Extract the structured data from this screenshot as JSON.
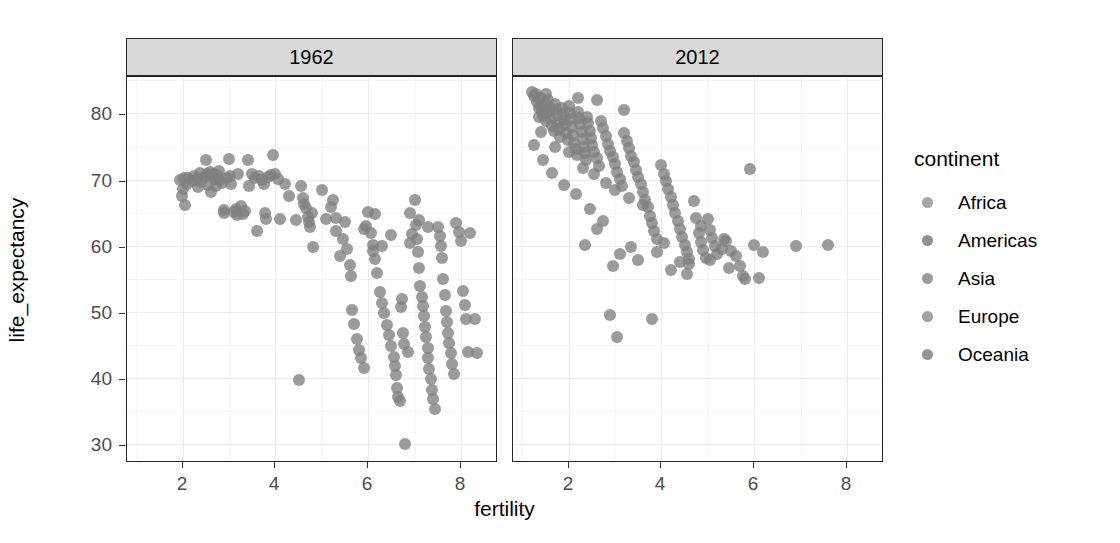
{
  "chart_data": {
    "type": "scatter",
    "title": "",
    "xlabel": "fertility",
    "ylabel": "life_expectancy",
    "xlim": [
      0.8,
      8.8
    ],
    "ylim": [
      27.5,
      85.5
    ],
    "xticks": [
      2,
      4,
      6,
      8
    ],
    "yticks": [
      30,
      40,
      50,
      60,
      70,
      80
    ],
    "grid": true,
    "legend": {
      "title": "continent",
      "position": "right",
      "entries": [
        {
          "label": "Africa",
          "color": "#969696"
        },
        {
          "label": "Americas",
          "color": "#7d7d7d"
        },
        {
          "label": "Asia",
          "color": "#8a8a8a"
        },
        {
          "label": "Europe",
          "color": "#929292"
        },
        {
          "label": "Oceania",
          "color": "#828282"
        }
      ]
    },
    "facet_variable": "year",
    "facets": [
      {
        "label": "1962",
        "points": [
          [
            1.95,
            69.9
          ],
          [
            2.0,
            68.6
          ],
          [
            2.02,
            70.2
          ],
          [
            1.98,
            67.6
          ],
          [
            2.05,
            66.1
          ],
          [
            2.1,
            69.4
          ],
          [
            2.12,
            70.3
          ],
          [
            2.2,
            69.8
          ],
          [
            2.25,
            70.6
          ],
          [
            2.3,
            70.1
          ],
          [
            2.33,
            68.9
          ],
          [
            2.38,
            71.0
          ],
          [
            2.4,
            69.6
          ],
          [
            2.45,
            70.4
          ],
          [
            2.5,
            73.0
          ],
          [
            2.52,
            70.8
          ],
          [
            2.55,
            69.2
          ],
          [
            2.58,
            71.2
          ],
          [
            2.6,
            70.5
          ],
          [
            2.62,
            68.2
          ],
          [
            2.65,
            70.9
          ],
          [
            2.7,
            70.1
          ],
          [
            2.72,
            69.0
          ],
          [
            2.75,
            70.7
          ],
          [
            2.78,
            71.3
          ],
          [
            2.8,
            70.0
          ],
          [
            2.85,
            69.5
          ],
          [
            2.88,
            64.9
          ],
          [
            2.9,
            65.4
          ],
          [
            2.95,
            70.2
          ],
          [
            3.0,
            73.1
          ],
          [
            3.02,
            70.6
          ],
          [
            3.05,
            69.4
          ],
          [
            3.1,
            65.1
          ],
          [
            3.15,
            65.6
          ],
          [
            3.18,
            64.6
          ],
          [
            3.2,
            70.9
          ],
          [
            3.25,
            66.0
          ],
          [
            3.3,
            64.8
          ],
          [
            3.35,
            65.3
          ],
          [
            3.4,
            73.0
          ],
          [
            3.42,
            69.1
          ],
          [
            3.5,
            70.8
          ],
          [
            3.55,
            70.3
          ],
          [
            3.6,
            62.3
          ],
          [
            3.65,
            70.5
          ],
          [
            3.7,
            70.0
          ],
          [
            3.75,
            69.3
          ],
          [
            3.78,
            65.0
          ],
          [
            3.8,
            64.1
          ],
          [
            3.85,
            70.4
          ],
          [
            3.9,
            70.7
          ],
          [
            3.95,
            73.8
          ],
          [
            4.0,
            70.9
          ],
          [
            4.05,
            70.1
          ],
          [
            4.1,
            64.0
          ],
          [
            4.2,
            69.3
          ],
          [
            4.3,
            67.5
          ],
          [
            4.45,
            63.9
          ],
          [
            4.5,
            39.8
          ],
          [
            4.55,
            69.1
          ],
          [
            4.6,
            67.2
          ],
          [
            4.62,
            66.3
          ],
          [
            4.65,
            65.7
          ],
          [
            4.7,
            64.3
          ],
          [
            4.72,
            63.6
          ],
          [
            4.75,
            62.9
          ],
          [
            4.78,
            65.0
          ],
          [
            4.8,
            59.9
          ],
          [
            5.0,
            68.4
          ],
          [
            5.1,
            64.0
          ],
          [
            5.2,
            65.9
          ],
          [
            5.25,
            67.0
          ],
          [
            5.3,
            62.2
          ],
          [
            5.4,
            58.4
          ],
          [
            5.45,
            61.0
          ],
          [
            5.5,
            63.6
          ],
          [
            5.55,
            59.5
          ],
          [
            5.6,
            57.1
          ],
          [
            5.62,
            55.4
          ],
          [
            5.65,
            50.3
          ],
          [
            5.7,
            48.2
          ],
          [
            5.75,
            46.0
          ],
          [
            5.8,
            44.3
          ],
          [
            5.85,
            43.0
          ],
          [
            5.9,
            41.5
          ],
          [
            5.95,
            63.0
          ],
          [
            6.0,
            65.1
          ],
          [
            6.05,
            62.0
          ],
          [
            6.1,
            60.2
          ],
          [
            6.15,
            58.0
          ],
          [
            6.2,
            55.9
          ],
          [
            6.25,
            53.0
          ],
          [
            6.3,
            51.4
          ],
          [
            6.35,
            49.8
          ],
          [
            6.4,
            48.0
          ],
          [
            6.45,
            46.5
          ],
          [
            6.5,
            44.9
          ],
          [
            6.55,
            43.2
          ],
          [
            6.58,
            41.8
          ],
          [
            6.6,
            40.5
          ],
          [
            6.62,
            38.6
          ],
          [
            6.65,
            37.2
          ],
          [
            6.68,
            36.5
          ],
          [
            6.7,
            50.8
          ],
          [
            6.72,
            52.0
          ],
          [
            6.75,
            46.8
          ],
          [
            6.78,
            45.2
          ],
          [
            6.8,
            30.0
          ],
          [
            6.85,
            43.9
          ],
          [
            6.9,
            60.5
          ],
          [
            6.95,
            61.8
          ],
          [
            7.0,
            66.9
          ],
          [
            7.02,
            63.2
          ],
          [
            7.05,
            61.0
          ],
          [
            7.08,
            59.0
          ],
          [
            7.1,
            56.7
          ],
          [
            7.12,
            54.0
          ],
          [
            7.15,
            52.3
          ],
          [
            7.18,
            50.9
          ],
          [
            7.2,
            49.4
          ],
          [
            7.22,
            47.8
          ],
          [
            7.25,
            46.2
          ],
          [
            7.28,
            44.6
          ],
          [
            7.3,
            43.0
          ],
          [
            7.32,
            41.4
          ],
          [
            7.35,
            39.9
          ],
          [
            7.38,
            38.2
          ],
          [
            7.4,
            36.8
          ],
          [
            7.45,
            35.3
          ],
          [
            7.5,
            62.8
          ],
          [
            7.55,
            61.5
          ],
          [
            7.58,
            60.0
          ],
          [
            7.6,
            58.2
          ],
          [
            7.62,
            55.0
          ],
          [
            7.65,
            52.6
          ],
          [
            7.68,
            50.2
          ],
          [
            7.7,
            48.5
          ],
          [
            7.72,
            46.9
          ],
          [
            7.75,
            45.4
          ],
          [
            7.78,
            43.8
          ],
          [
            7.8,
            42.1
          ],
          [
            7.85,
            40.6
          ],
          [
            7.9,
            63.5
          ],
          [
            7.95,
            62.1
          ],
          [
            8.0,
            60.7
          ],
          [
            8.05,
            53.2
          ],
          [
            8.08,
            51.0
          ],
          [
            8.1,
            48.9
          ],
          [
            8.15,
            44.0
          ],
          [
            8.2,
            61.9
          ],
          [
            8.3,
            49.0
          ],
          [
            8.35,
            43.8
          ],
          [
            6.15,
            64.8
          ],
          [
            5.3,
            64.2
          ],
          [
            5.9,
            62.5
          ],
          [
            6.9,
            64.9
          ],
          [
            7.1,
            63.9
          ],
          [
            7.3,
            62.9
          ],
          [
            6.5,
            61.6
          ],
          [
            6.3,
            60.0
          ],
          [
            6.1,
            59.2
          ]
        ]
      },
      {
        "label": "2012",
        "points": [
          [
            1.2,
            83.2
          ],
          [
            1.25,
            82.6
          ],
          [
            1.3,
            82.9
          ],
          [
            1.32,
            81.8
          ],
          [
            1.35,
            80.9
          ],
          [
            1.38,
            82.3
          ],
          [
            1.4,
            81.2
          ],
          [
            1.42,
            80.4
          ],
          [
            1.45,
            79.6
          ],
          [
            1.48,
            81.6
          ],
          [
            1.5,
            80.1
          ],
          [
            1.52,
            78.9
          ],
          [
            1.55,
            82.0
          ],
          [
            1.58,
            81.0
          ],
          [
            1.6,
            80.3
          ],
          [
            1.62,
            79.2
          ],
          [
            1.65,
            78.1
          ],
          [
            1.68,
            77.3
          ],
          [
            1.7,
            81.4
          ],
          [
            1.72,
            80.6
          ],
          [
            1.75,
            79.8
          ],
          [
            1.78,
            78.6
          ],
          [
            1.8,
            77.6
          ],
          [
            1.82,
            76.5
          ],
          [
            1.85,
            80.8
          ],
          [
            1.88,
            79.9
          ],
          [
            1.9,
            79.0
          ],
          [
            1.92,
            78.2
          ],
          [
            1.95,
            77.0
          ],
          [
            1.98,
            76.0
          ],
          [
            2.0,
            81.1
          ],
          [
            2.02,
            80.0
          ],
          [
            2.05,
            79.1
          ],
          [
            2.08,
            78.0
          ],
          [
            2.1,
            76.8
          ],
          [
            2.12,
            75.5
          ],
          [
            2.15,
            74.6
          ],
          [
            2.18,
            73.8
          ],
          [
            2.2,
            80.2
          ],
          [
            2.22,
            79.3
          ],
          [
            2.25,
            78.4
          ],
          [
            2.28,
            77.2
          ],
          [
            2.3,
            76.1
          ],
          [
            2.32,
            75.0
          ],
          [
            2.35,
            74.0
          ],
          [
            2.38,
            73.0
          ],
          [
            2.4,
            79.5
          ],
          [
            2.42,
            78.5
          ],
          [
            2.45,
            77.4
          ],
          [
            2.48,
            76.3
          ],
          [
            2.5,
            75.2
          ],
          [
            2.55,
            74.2
          ],
          [
            2.6,
            73.2
          ],
          [
            2.65,
            72.0
          ],
          [
            2.7,
            78.8
          ],
          [
            2.75,
            77.8
          ],
          [
            2.8,
            76.6
          ],
          [
            2.85,
            75.4
          ],
          [
            2.9,
            74.4
          ],
          [
            2.95,
            73.4
          ],
          [
            3.0,
            72.4
          ],
          [
            3.05,
            71.2
          ],
          [
            3.1,
            70.1
          ],
          [
            3.15,
            69.0
          ],
          [
            3.2,
            77.0
          ],
          [
            3.25,
            75.8
          ],
          [
            3.3,
            74.8
          ],
          [
            3.35,
            73.6
          ],
          [
            3.4,
            72.6
          ],
          [
            3.45,
            71.5
          ],
          [
            3.5,
            70.4
          ],
          [
            3.55,
            69.4
          ],
          [
            3.6,
            68.2
          ],
          [
            3.65,
            67.0
          ],
          [
            3.7,
            65.8
          ],
          [
            3.75,
            64.5
          ],
          [
            3.8,
            63.4
          ],
          [
            3.85,
            62.2
          ],
          [
            3.9,
            61.0
          ],
          [
            3.2,
            80.5
          ],
          [
            2.6,
            82.0
          ],
          [
            2.2,
            82.4
          ],
          [
            1.5,
            83.0
          ],
          [
            1.35,
            79.4
          ],
          [
            1.4,
            77.2
          ],
          [
            1.7,
            75.0
          ],
          [
            2.0,
            74.2
          ],
          [
            2.3,
            71.8
          ],
          [
            2.55,
            70.8
          ],
          [
            2.8,
            69.5
          ],
          [
            3.0,
            68.5
          ],
          [
            3.3,
            67.3
          ],
          [
            3.6,
            66.1
          ],
          [
            3.9,
            59.0
          ],
          [
            4.0,
            72.2
          ],
          [
            4.05,
            70.9
          ],
          [
            4.1,
            69.8
          ],
          [
            4.15,
            68.6
          ],
          [
            4.2,
            67.4
          ],
          [
            4.25,
            66.2
          ],
          [
            4.3,
            65.0
          ],
          [
            4.35,
            63.8
          ],
          [
            4.4,
            62.6
          ],
          [
            4.45,
            61.4
          ],
          [
            4.5,
            60.2
          ],
          [
            4.55,
            59.0
          ],
          [
            4.6,
            58.0
          ],
          [
            4.7,
            66.8
          ],
          [
            4.75,
            64.2
          ],
          [
            4.8,
            62.0
          ],
          [
            4.85,
            60.6
          ],
          [
            4.9,
            59.4
          ],
          [
            4.95,
            58.2
          ],
          [
            5.0,
            64.0
          ],
          [
            5.05,
            62.4
          ],
          [
            5.1,
            61.2
          ],
          [
            5.15,
            60.0
          ],
          [
            5.2,
            58.8
          ],
          [
            5.3,
            59.6
          ],
          [
            5.4,
            60.8
          ],
          [
            5.5,
            59.2
          ],
          [
            5.6,
            58.4
          ],
          [
            5.7,
            57.0
          ],
          [
            5.75,
            55.4
          ],
          [
            5.8,
            55.0
          ],
          [
            5.9,
            71.6
          ],
          [
            6.0,
            60.2
          ],
          [
            6.1,
            55.2
          ],
          [
            6.2,
            59.0
          ],
          [
            7.6,
            60.1
          ],
          [
            6.9,
            60.0
          ],
          [
            3.1,
            58.8
          ],
          [
            2.95,
            57.0
          ],
          [
            2.6,
            62.6
          ],
          [
            2.9,
            49.5
          ],
          [
            3.05,
            46.2
          ],
          [
            3.8,
            48.9
          ],
          [
            4.55,
            55.8
          ],
          [
            4.6,
            57.2
          ],
          [
            5.05,
            57.8
          ],
          [
            5.45,
            56.6
          ],
          [
            4.2,
            56.4
          ],
          [
            4.4,
            57.6
          ],
          [
            3.5,
            57.9
          ],
          [
            3.35,
            59.8
          ],
          [
            2.75,
            63.8
          ],
          [
            2.45,
            65.6
          ],
          [
            2.15,
            67.8
          ],
          [
            1.9,
            69.2
          ],
          [
            1.65,
            71.0
          ],
          [
            1.45,
            73.0
          ],
          [
            1.25,
            75.2
          ],
          [
            4.05,
            60.4
          ],
          [
            4.85,
            63.0
          ],
          [
            5.35,
            61.0
          ],
          [
            2.35,
            60.2
          ]
        ]
      }
    ]
  }
}
